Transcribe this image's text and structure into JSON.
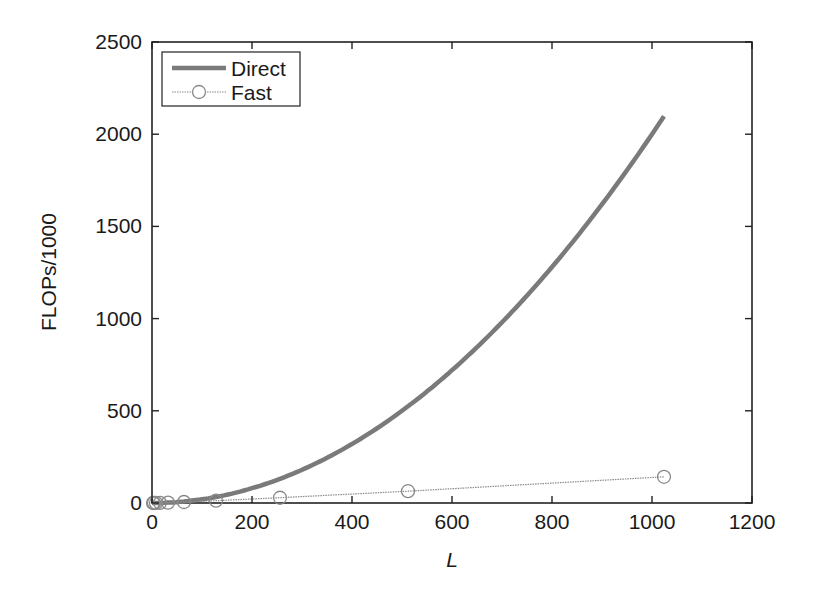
{
  "chart_data": {
    "type": "line",
    "title": "",
    "xlabel": "L",
    "ylabel": "FLOPs/1000",
    "xlim": [
      0,
      1200
    ],
    "ylim": [
      0,
      2500
    ],
    "xticks": [
      0,
      200,
      400,
      600,
      800,
      1000,
      1200
    ],
    "yticks": [
      0,
      500,
      1000,
      1500,
      2000,
      2500
    ],
    "grid": false,
    "legend_position": "upper left",
    "series": [
      {
        "name": "Direct",
        "style": "thick solid line, no markers",
        "color": "#7a7a7a",
        "x": [
          0,
          64,
          128,
          192,
          256,
          320,
          384,
          448,
          512,
          576,
          640,
          704,
          768,
          832,
          896,
          960,
          1024
        ],
        "values": [
          0,
          8,
          33,
          74,
          131,
          205,
          295,
          402,
          524,
          664,
          819,
          991,
          1180,
          1384,
          1606,
          1843,
          2097
        ]
      },
      {
        "name": "Fast",
        "style": "thin dotted line with circle markers",
        "color": "#8a8a8a",
        "x": [
          2,
          4,
          8,
          16,
          32,
          64,
          128,
          256,
          512,
          1024
        ],
        "values": [
          0.03,
          0.1,
          0.3,
          0.9,
          2.2,
          5.3,
          12.5,
          28.5,
          64,
          142
        ]
      }
    ]
  },
  "plot": {
    "left": 152,
    "right": 752,
    "top": 42,
    "bottom": 503
  }
}
